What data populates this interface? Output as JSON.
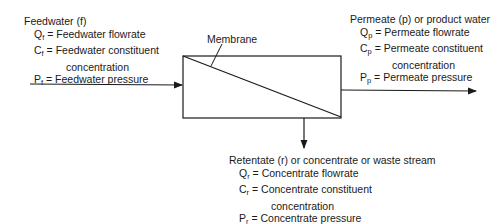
{
  "membrane_label": "Membrane",
  "feedwater": {
    "title": "Feedwater (f)",
    "items": [
      {
        "symbol": "Q",
        "sub": "f",
        "text": "= Feedwater flowrate"
      },
      {
        "symbol": "C",
        "sub": "f",
        "text": "= Feedwater constituent",
        "cont": "concentration"
      },
      {
        "symbol": "P",
        "sub": "f",
        "text": "= Feedwater pressure"
      }
    ]
  },
  "permeate": {
    "title": "Permeate (p) or product water",
    "items": [
      {
        "symbol": "Q",
        "sub": "p",
        "text": "= Permeate flowrate"
      },
      {
        "symbol": "C",
        "sub": "p",
        "text": "= Permeate constituent",
        "cont": "concentration"
      },
      {
        "symbol": "P",
        "sub": "p",
        "text": "= Permeate pressure"
      }
    ]
  },
  "retentate": {
    "title": "Retentate (r) or concentrate or waste stream",
    "items": [
      {
        "symbol": "Q",
        "sub": "r",
        "text": "= Concentrate flowrate"
      },
      {
        "symbol": "C",
        "sub": "r",
        "text": "= Concentrate constituent",
        "cont": "concentration"
      },
      {
        "symbol": "P",
        "sub": "r",
        "text": "= Concentrate pressure"
      }
    ]
  },
  "colors": {
    "line": "#1a1a1a",
    "background": "#ffffff"
  }
}
